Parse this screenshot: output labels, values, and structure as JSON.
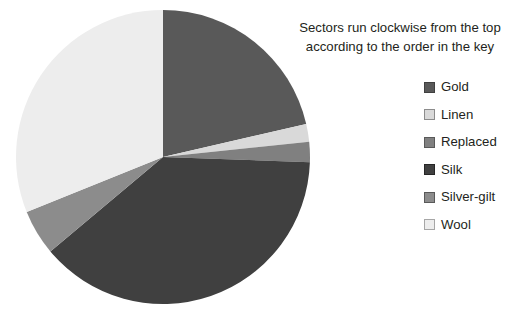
{
  "caption": {
    "line1": "Sectors run clockwise from the top",
    "line2": "according to the order in the key"
  },
  "legend": {
    "items": [
      {
        "label": "Gold",
        "color": "#595959",
        "border": "#404040"
      },
      {
        "label": "Linen",
        "color": "#d9d9d9",
        "border": "#8c8c8c"
      },
      {
        "label": "Replaced",
        "color": "#808080",
        "border": "#595959"
      },
      {
        "label": "Silk",
        "color": "#404040",
        "border": "#262626"
      },
      {
        "label": "Silver-gilt",
        "color": "#8c8c8c",
        "border": "#595959"
      },
      {
        "label": "Wool",
        "color": "#ededed",
        "border": "#a6a6a6"
      }
    ]
  },
  "chart_data": {
    "type": "pie",
    "title": "",
    "note": "Sectors run clockwise from the top according to the order in the key",
    "start_angle_deg": 0,
    "direction": "clockwise",
    "center": [
      163,
      157
    ],
    "radius": 147,
    "categories": [
      "Gold",
      "Linen",
      "Replaced",
      "Silk",
      "Silver-gilt",
      "Wool"
    ],
    "values": [
      21.4,
      1.9,
      2.2,
      38.3,
      5.0,
      31.2
    ],
    "unit": "percent",
    "slices": [
      {
        "label": "Gold",
        "value": 21.4,
        "start_deg": 0.0,
        "end_deg": 77.0,
        "color": "#595959"
      },
      {
        "label": "Linen",
        "value": 1.9,
        "start_deg": 77.0,
        "end_deg": 84.0,
        "color": "#d9d9d9"
      },
      {
        "label": "Replaced",
        "value": 2.2,
        "start_deg": 84.0,
        "end_deg": 92.0,
        "color": "#808080"
      },
      {
        "label": "Silk",
        "value": 38.3,
        "start_deg": 92.0,
        "end_deg": 230.0,
        "color": "#404040"
      },
      {
        "label": "Silver-gilt",
        "value": 5.0,
        "start_deg": 230.0,
        "end_deg": 248.0,
        "color": "#8c8c8c"
      },
      {
        "label": "Wool",
        "value": 31.2,
        "start_deg": 248.0,
        "end_deg": 360.0,
        "color": "#ededed"
      }
    ],
    "legend_position": "right",
    "labels_shown": false,
    "grid": false
  }
}
